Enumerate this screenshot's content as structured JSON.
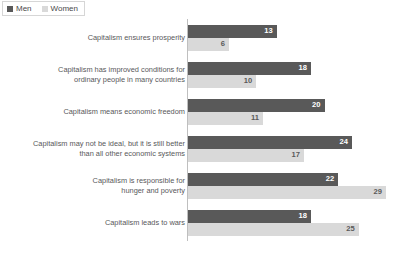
{
  "legend": {
    "position": "top-left",
    "items": [
      {
        "label": "Men",
        "color": "#595959",
        "icon": "square-swatch-icon"
      },
      {
        "label": "Women",
        "color": "#d9d9d9",
        "icon": "square-swatch-icon"
      }
    ]
  },
  "footnote": {
    "text": ""
  },
  "colors": {
    "men": "#595959",
    "women": "#d9d9d9",
    "axis": "#bfbfbf",
    "text": "#58585a",
    "background": "#ffffff"
  },
  "chart_data": {
    "type": "bar",
    "orientation": "horizontal",
    "title": "",
    "subtitle": "",
    "xlabel": "",
    "ylabel": "",
    "xlim": [
      0,
      29
    ],
    "grid": false,
    "legend_position": "top-left",
    "categories": [
      "Capitalism ensures prosperity",
      "Capitalism has improved conditions for\nordinary people in many countries",
      "Capitalism means economic freedom",
      "Capitalism may not be ideal, but it is still better\nthan all other economic systems",
      "Capitalism is responsible for\nhunger and poverty",
      "Capitalism leads to wars"
    ],
    "series": [
      {
        "name": "Men",
        "color": "#595959",
        "values": [
          13,
          18,
          20,
          24,
          22,
          18
        ]
      },
      {
        "name": "Women",
        "color": "#d9d9d9",
        "values": [
          6,
          10,
          11,
          17,
          29,
          25
        ]
      }
    ]
  }
}
